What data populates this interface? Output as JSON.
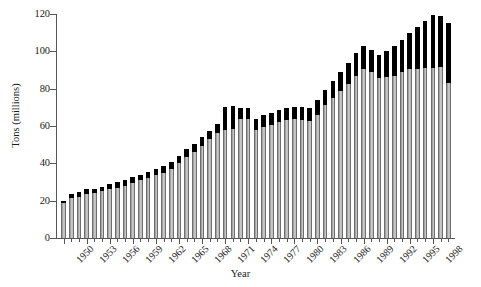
{
  "chart_data": {
    "type": "bar",
    "title": "",
    "xlabel": "Year",
    "ylabel": "Tons (millions)",
    "ylim": [
      0,
      120
    ],
    "ytick_values": [
      0,
      20,
      40,
      60,
      80,
      100,
      120
    ],
    "ytick_labels": [
      "0",
      "20",
      "40",
      "60",
      "80",
      "100",
      "120"
    ],
    "grid": false,
    "legend": "none",
    "stacked": true,
    "bar_colors": {
      "lower": "#b0b0b0",
      "upper": "#000000"
    },
    "axis_color": "#555555",
    "categories": [
      "1950",
      "1951",
      "1952",
      "1953",
      "1954",
      "1955",
      "1956",
      "1957",
      "1958",
      "1959",
      "1960",
      "1961",
      "1962",
      "1963",
      "1964",
      "1965",
      "1966",
      "1967",
      "1968",
      "1969",
      "1970",
      "1971",
      "1972",
      "1973",
      "1974",
      "1975",
      "1976",
      "1977",
      "1978",
      "1979",
      "1980",
      "1981",
      "1982",
      "1983",
      "1984",
      "1985",
      "1986",
      "1987",
      "1988",
      "1989",
      "1990",
      "1991",
      "1992",
      "1993",
      "1994",
      "1995",
      "1996",
      "1997",
      "1998",
      "1999",
      "2000"
    ],
    "xtick_labeled": [
      "1950",
      "1953",
      "1956",
      "1959",
      "1962",
      "1965",
      "1968",
      "1971",
      "1974",
      "1977",
      "1980",
      "1983",
      "1986",
      "1989",
      "1992",
      "1995",
      "1998"
    ],
    "series": [
      {
        "name": "lower-segment",
        "values": [
          18.5,
          21.5,
          22.0,
          23.5,
          24.0,
          25.0,
          26.0,
          27.0,
          28.0,
          29.5,
          31.0,
          32.0,
          33.5,
          35.0,
          37.0,
          40.0,
          43.5,
          46.0,
          49.5,
          53.0,
          56.0,
          58.0,
          58.5,
          63.5,
          63.5,
          58.0,
          59.5,
          60.5,
          62.0,
          63.0,
          63.5,
          63.0,
          62.5,
          66.0,
          71.0,
          75.0,
          79.0,
          82.5,
          87.0,
          90.5,
          89.0,
          85.5,
          86.0,
          87.0,
          89.0,
          90.5,
          90.5,
          91.0,
          91.0,
          91.5,
          83.0
        ]
      },
      {
        "name": "upper-segment",
        "values": [
          1.5,
          2.0,
          2.5,
          2.5,
          2.5,
          2.5,
          3.0,
          3.0,
          3.0,
          3.0,
          3.0,
          3.5,
          3.5,
          3.5,
          3.5,
          4.0,
          4.0,
          4.5,
          4.5,
          4.5,
          5.0,
          12.0,
          12.0,
          6.0,
          6.0,
          6.0,
          6.5,
          6.5,
          6.5,
          6.5,
          6.5,
          7.0,
          7.0,
          8.0,
          8.5,
          9.0,
          10.0,
          11.0,
          12.0,
          12.5,
          11.5,
          12.5,
          14.0,
          16.0,
          17.0,
          19.5,
          22.5,
          25.5,
          28.5,
          27.5,
          32.0
        ]
      }
    ],
    "totals": [
      20.0,
      23.5,
      24.5,
      26.0,
      26.5,
      27.5,
      29.0,
      30.0,
      31.0,
      32.5,
      34.0,
      35.5,
      37.0,
      38.5,
      40.5,
      44.0,
      47.5,
      50.5,
      54.0,
      57.5,
      61.0,
      70.0,
      70.5,
      69.5,
      69.5,
      64.0,
      66.0,
      67.0,
      68.5,
      69.5,
      70.0,
      70.0,
      69.5,
      74.0,
      79.5,
      84.0,
      89.0,
      93.5,
      99.0,
      103.0,
      100.5,
      98.0,
      100.0,
      103.0,
      106.0,
      110.0,
      113.0,
      116.5,
      119.5,
      119.0,
      115.0
    ]
  }
}
